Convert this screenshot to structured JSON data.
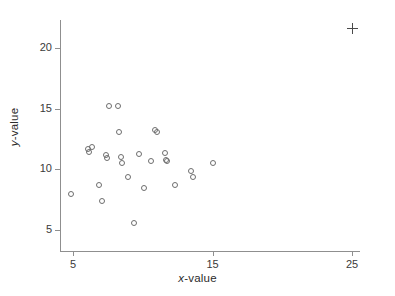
{
  "chart_data": {
    "type": "scatter",
    "title": "",
    "xlabel": "x-value",
    "ylabel": "y-value",
    "xlabel_parts": {
      "variable": "x",
      "suffix": "-value"
    },
    "ylabel_parts": {
      "variable": "y",
      "suffix": "-value"
    },
    "xlim": [
      4.2,
      26.5
    ],
    "ylim": [
      4.2,
      22.6
    ],
    "xticks": [
      5,
      15,
      25
    ],
    "xticklabels": [
      "5",
      "15",
      "25"
    ],
    "yticks": [
      5,
      10,
      15,
      20
    ],
    "yticklabels": [
      "5",
      "10",
      "15",
      "20"
    ],
    "grid": false,
    "legend": null,
    "series": [
      {
        "name": "data",
        "marker": "open-circle",
        "color": "#6e6e6e",
        "points": [
          [
            4.85,
            7.95
          ],
          [
            6.05,
            11.65
          ],
          [
            6.15,
            11.45
          ],
          [
            6.35,
            11.85
          ],
          [
            6.85,
            8.75
          ],
          [
            7.05,
            7.35
          ],
          [
            7.35,
            11.15
          ],
          [
            7.45,
            10.95
          ],
          [
            7.55,
            15.2
          ],
          [
            8.25,
            15.2
          ],
          [
            8.3,
            13.05
          ],
          [
            8.45,
            11.05
          ],
          [
            8.5,
            10.5
          ],
          [
            8.95,
            9.35
          ],
          [
            9.35,
            5.55
          ],
          [
            9.7,
            11.3
          ],
          [
            10.1,
            8.45
          ],
          [
            10.6,
            10.7
          ],
          [
            10.85,
            13.25
          ],
          [
            11.0,
            13.05
          ],
          [
            11.6,
            11.35
          ],
          [
            11.65,
            10.8
          ],
          [
            11.75,
            10.65
          ],
          [
            12.3,
            8.7
          ],
          [
            13.45,
            9.9
          ],
          [
            13.6,
            9.4
          ],
          [
            15.0,
            10.5
          ]
        ]
      },
      {
        "name": "outlier",
        "marker": "plus",
        "color": "#4a4a4a",
        "points": [
          [
            25.0,
            21.6
          ]
        ]
      }
    ]
  }
}
